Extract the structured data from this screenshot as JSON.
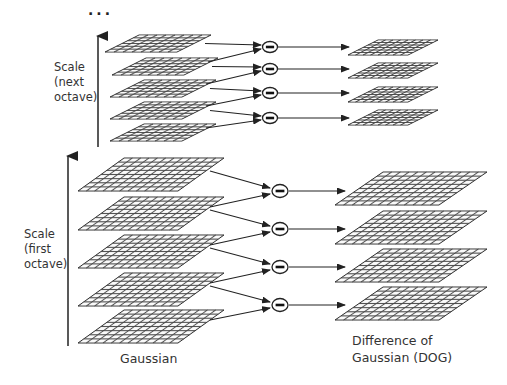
{
  "diagram": {
    "ellipsis": "...",
    "colors": {
      "line": "#222222",
      "grid_fill": "#ffffff",
      "grid_stroke": "#3a3a3a",
      "text": "#333333"
    },
    "top_octave": {
      "axis_label_lines": [
        "Scale",
        "(next",
        "octave)"
      ],
      "gaussian_layers": 5,
      "dog_layers": 4,
      "grid_cols": 8,
      "grid_rows": 6
    },
    "bottom_octave": {
      "axis_label_lines": [
        "Scale",
        "(first",
        "octave)"
      ],
      "gaussian_layers": 5,
      "dog_layers": 4,
      "grid_cols": 12,
      "grid_rows": 8
    },
    "operator_symbol": "minus",
    "captions": {
      "gaussian": "Gaussian",
      "dog_line1": "Difference of",
      "dog_line2": "Gaussian (DOG)"
    }
  }
}
